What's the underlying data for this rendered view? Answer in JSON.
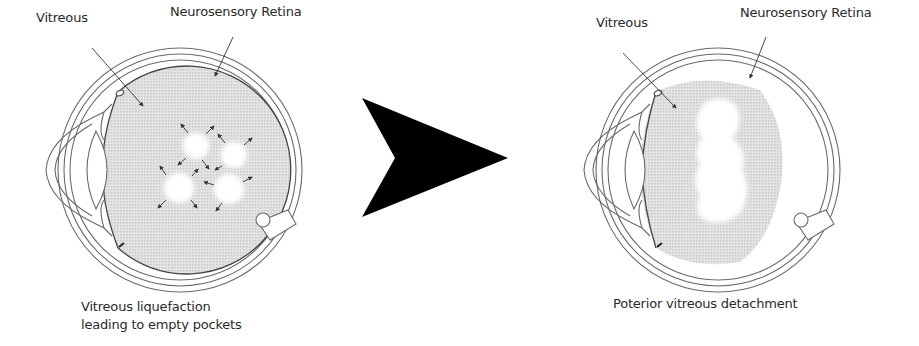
{
  "left_panel": {
    "label_vitreous": "Vitreous",
    "label_retina": "Neurosensory Retina",
    "caption_line1": "Vitreous liquefaction",
    "caption_line2": "leading to empty pockets"
  },
  "right_panel": {
    "label_vitreous": "Vitreous",
    "label_retina": "Neurosensory Retina",
    "caption": "Poterior vitreous detachment"
  },
  "arrow": {
    "direction": "right",
    "color": "#000000"
  },
  "colors": {
    "line": "#6a6a6a",
    "vitreous_fill": "#d9d9d9",
    "pocket_fill": "#ffffff",
    "arrow_fill": "#000000"
  }
}
